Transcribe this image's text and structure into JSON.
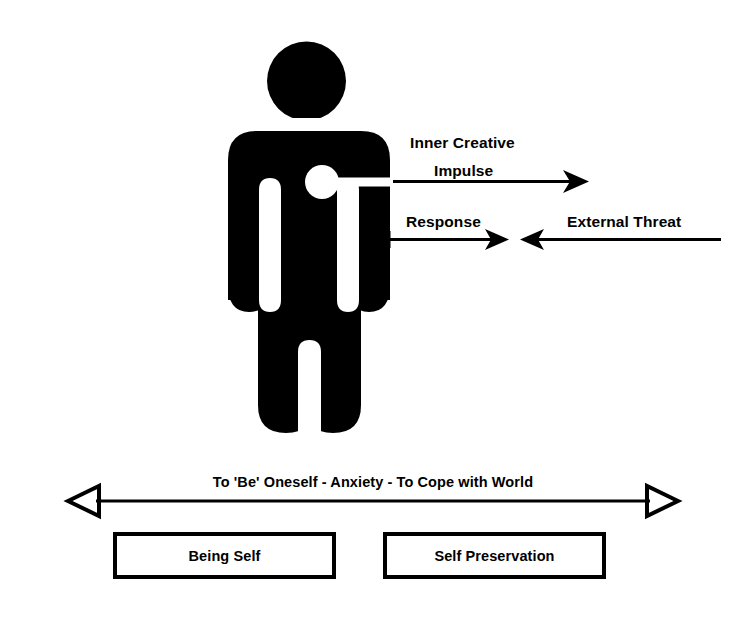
{
  "diagram": {
    "background_color": "#ffffff",
    "ink_color": "#000000",
    "figure": {
      "name": "human-pictogram",
      "chest_marker": "white-circle"
    },
    "arrows": {
      "impulse": {
        "label_line1": "Inner Creative",
        "label_line2": "Impulse",
        "direction": "right",
        "head_style": "solid-barb",
        "origin": "chest"
      },
      "response": {
        "label": "Response",
        "direction": "right",
        "head_style": "solid-barb",
        "origin": "body"
      },
      "threat": {
        "label": "External Threat",
        "direction": "left",
        "head_style": "solid-barb",
        "origin": "right-edge"
      }
    },
    "axis": {
      "caption": "To 'Be' Oneself - Anxiety - To Cope with World",
      "left_head": "hollow-triangle-left",
      "right_head": "hollow-triangle-right"
    },
    "boxes": [
      {
        "label": "Being Self"
      },
      {
        "label": "Self Preservation"
      }
    ]
  }
}
